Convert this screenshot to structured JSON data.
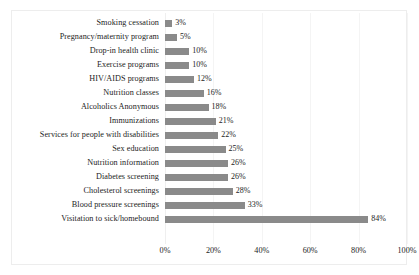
{
  "chart_data": {
    "type": "bar",
    "orientation": "horizontal",
    "title": "",
    "subtitle": "",
    "xlabel": "",
    "ylabel": "",
    "xlim": [
      0,
      100
    ],
    "grid": true,
    "legend": false,
    "legend_position": "none",
    "bar_color": "#8a8a8a",
    "frame_color": "#ededed",
    "text_color": "#1d1d1d",
    "value_suffix": "%",
    "categories": [
      "Smoking cessation",
      "Pregnancy/maternity program",
      "Drop-in health clinic",
      "Exercise programs",
      "HIV/AIDS programs",
      "Nutrition classes",
      "Alcoholics Anonymous",
      "Immunizations",
      "Services for people with disabilities",
      "Sex education",
      "Nutrition information",
      "Diabetes screening",
      "Cholesterol screenings",
      "Blood pressure screenings",
      "Visitation to sick/homebound"
    ],
    "values": [
      3,
      5,
      10,
      10,
      12,
      16,
      18,
      21,
      22,
      25,
      26,
      26,
      28,
      33,
      84
    ],
    "data_labels": [
      "3%",
      "5%",
      "10%",
      "10%",
      "12%",
      "16%",
      "18%",
      "21%",
      "22%",
      "25%",
      "26%",
      "26%",
      "28%",
      "33%",
      "84%"
    ],
    "xticks": [
      0,
      20,
      40,
      60,
      80,
      100
    ],
    "xtick_labels": [
      "0%",
      "20%",
      "40%",
      "60%",
      "80%",
      "100%"
    ]
  }
}
